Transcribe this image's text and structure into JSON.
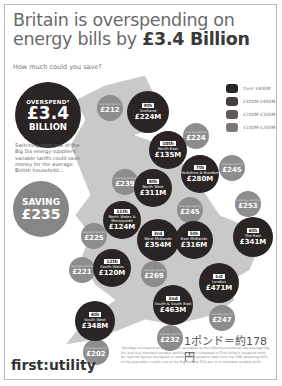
{
  "header": {
    "title_line1": "Britain is overspending on",
    "title_line2_prefix": "energy bills by ",
    "title_line2_bold": "£3.4 Billion",
    "subtitle": "How much could you save?"
  },
  "overspend_badge": {
    "label": "OVERSPEND*",
    "amount": "£3.4",
    "unit": "BILLION"
  },
  "blurb": "Switching from one of the Big Six energy suppliers' variable tariffs could save money for the average British household...",
  "saving_badge": {
    "label": "SAVING",
    "amount": "£235"
  },
  "legend": [
    {
      "label": "Over £400M",
      "color": "#2a2424"
    },
    {
      "label": "£300M-£400M",
      "color": "#444040"
    },
    {
      "label": "£200M-£300M",
      "color": "#5e5a5a"
    },
    {
      "label": "£100M-£200M",
      "color": "#7a7777"
    }
  ],
  "regions": [
    {
      "rank": "9th",
      "name": "Scotland",
      "sub": "overspending by",
      "amount": "£224M",
      "saving": "£212"
    },
    {
      "rank": "10th",
      "name": "North East",
      "sub": "overspending by",
      "amount": "£135M",
      "saving": "£224"
    },
    {
      "rank": "7th",
      "name": "Yorkshire & Humber",
      "sub": "overspending by",
      "amount": "£280M",
      "saving": "£245"
    },
    {
      "rank": "8th",
      "name": "North West",
      "sub": "overspending by",
      "amount": "£311M",
      "saving": "£239"
    },
    {
      "rank": "11th",
      "name": "North Wales & Merseyside",
      "sub": "overspending by",
      "amount": "£124M",
      "saving": "£225"
    },
    {
      "rank": "3rd",
      "name": "West Midlands",
      "sub": "overspending by",
      "amount": "£354M",
      "saving": "£269"
    },
    {
      "rank": "5th",
      "name": "East Midlands",
      "sub": "overspending by",
      "amount": "£316M",
      "saving": "£245"
    },
    {
      "rank": "6th",
      "name": "The East",
      "sub": "overspending by",
      "amount": "£341M",
      "saving": "£253"
    },
    {
      "rank": "12th",
      "name": "South Wales",
      "sub": "overspending by",
      "amount": "£120M",
      "saving": "£221"
    },
    {
      "rank": "1st",
      "name": "London",
      "sub": "overspending by",
      "amount": "£471M",
      "saving": "£247"
    },
    {
      "rank": "2nd",
      "name": "South & South East",
      "sub": "overspending by",
      "amount": "£463M",
      "saving": "£232"
    },
    {
      "rank": "4th",
      "name": "South West",
      "sub": "overspending by",
      "amount": "£348M",
      "saving": "£202"
    }
  ],
  "saving_label": "average saving",
  "annotation_yen": "1ポンド＝約178円",
  "footnote": "*Average overspend on energy bills calculated as the difference between the average Big Six dual fuel standard variable tariff by region compared to First Utility's cheapest tariff. All regional figures are based on estimated population data from the ONS assuming 80% of the population is with one of the Big Six and 70% are on a standard variable tariff.",
  "logo": "first:utility"
}
